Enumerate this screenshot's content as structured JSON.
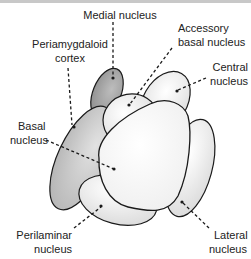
{
  "diagram": {
    "labels": {
      "medial": "Medial nucleus",
      "periamygdaloid_1": "Periamygdaloid",
      "periamygdaloid_2": "cortex",
      "accessory_1": "Accessory",
      "accessory_2": "basal nucleus",
      "central_1": "Central",
      "central_2": "nucleus",
      "basal_1": "Basal",
      "basal_2": "nucleus",
      "perilaminar_1": "Perilaminar",
      "perilaminar_2": "nucleus",
      "lateral_1": "Lateral",
      "lateral_2": "nucleus"
    },
    "colors": {
      "outline": "#1a1a1a",
      "dark_fill": "#a8a8a8",
      "mid_fill": "#c8c8c8",
      "light_fill": "#e4e4e4",
      "white_fill": "#ffffff",
      "frame": "#c8c8c8"
    }
  }
}
